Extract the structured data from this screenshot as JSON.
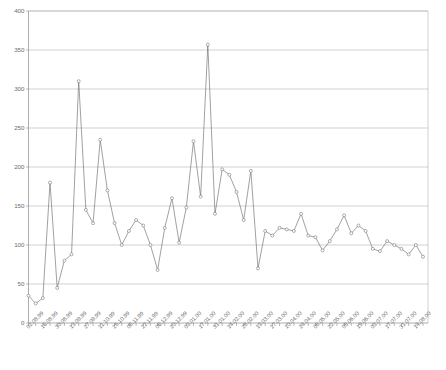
{
  "chart_data": {
    "type": "line",
    "title": "",
    "subtitle": "",
    "xlabel": "",
    "ylabel": "",
    "ylim": [
      0,
      400
    ],
    "ytick_step": 50,
    "ytick_labels": [
      "0",
      "50",
      "100",
      "150",
      "200",
      "250",
      "300",
      "350",
      "400"
    ],
    "ytick_values": [
      0,
      50,
      100,
      150,
      200,
      250,
      300,
      350,
      400
    ],
    "grid": "horizontal",
    "legend": "none",
    "marker": "open-circle",
    "line_color": "#6e6e6e",
    "grid_color": "#b3b3b3",
    "axis_color": "#8a8a8a",
    "x_label_rotation": -45,
    "x_label_interval": 2,
    "x_tick_interval_days": 7,
    "xtick_labels": [
      "02.08.99",
      "16.08.99",
      "30.08.99",
      "13.09.99",
      "27.09.99",
      "11.10.99",
      "25.10.99",
      "08.11.99",
      "22.11.99",
      "06.12.99",
      "20.12.99",
      "03.01.00",
      "17.01.00",
      "31.01.00",
      "14.02.00",
      "28.02.00",
      "13.03.00",
      "27.03.00",
      "10.04.00",
      "24.04.00",
      "08.05.00",
      "22.05.00",
      "05.06.00",
      "19.06.00",
      "03.07.00",
      "17.07.00",
      "31.07.00",
      "14.08.00"
    ],
    "x": [
      "02.08.99",
      "09.08.99",
      "16.08.99",
      "23.08.99",
      "30.08.99",
      "06.09.99",
      "13.09.99",
      "20.09.99",
      "27.09.99",
      "04.10.99",
      "11.10.99",
      "18.10.99",
      "25.10.99",
      "01.11.99",
      "08.11.99",
      "15.11.99",
      "22.11.99",
      "29.11.99",
      "06.12.99",
      "13.12.99",
      "20.12.99",
      "27.12.99",
      "03.01.00",
      "10.01.00",
      "17.01.00",
      "24.01.00",
      "31.01.00",
      "07.02.00",
      "14.02.00",
      "21.02.00",
      "28.02.00",
      "06.03.00",
      "13.03.00",
      "20.03.00",
      "27.03.00",
      "03.04.00",
      "10.04.00",
      "17.04.00",
      "24.04.00",
      "01.05.00",
      "08.05.00",
      "15.05.00",
      "22.05.00",
      "29.05.00",
      "05.06.00",
      "12.06.00",
      "19.06.00",
      "26.06.00",
      "03.07.00",
      "10.07.00",
      "17.07.00",
      "24.07.00",
      "31.07.00",
      "07.08.00",
      "14.08.00",
      "21.08.00"
    ],
    "values": [
      35,
      25,
      32,
      180,
      45,
      80,
      88,
      310,
      145,
      128,
      235,
      170,
      128,
      100,
      118,
      132,
      125,
      100,
      68,
      122,
      160,
      103,
      148,
      233,
      162,
      357,
      140,
      197,
      190,
      168,
      132,
      195,
      70,
      118,
      112,
      122,
      120,
      118,
      140,
      112,
      110,
      93,
      105,
      120,
      138,
      115,
      125,
      118,
      95,
      92,
      105,
      100,
      95,
      88,
      100,
      85
    ],
    "series": [
      {
        "name": "series-1",
        "values": [
          35,
          25,
          32,
          180,
          45,
          80,
          88,
          310,
          145,
          128,
          235,
          170,
          128,
          100,
          118,
          132,
          125,
          100,
          68,
          122,
          160,
          103,
          148,
          233,
          162,
          357,
          140,
          197,
          190,
          168,
          132,
          195,
          70,
          118,
          112,
          122,
          120,
          118,
          140,
          112,
          110,
          93,
          105,
          120,
          138,
          115,
          125,
          118,
          95,
          92,
          105,
          100,
          95,
          88,
          100,
          85
        ]
      }
    ]
  }
}
